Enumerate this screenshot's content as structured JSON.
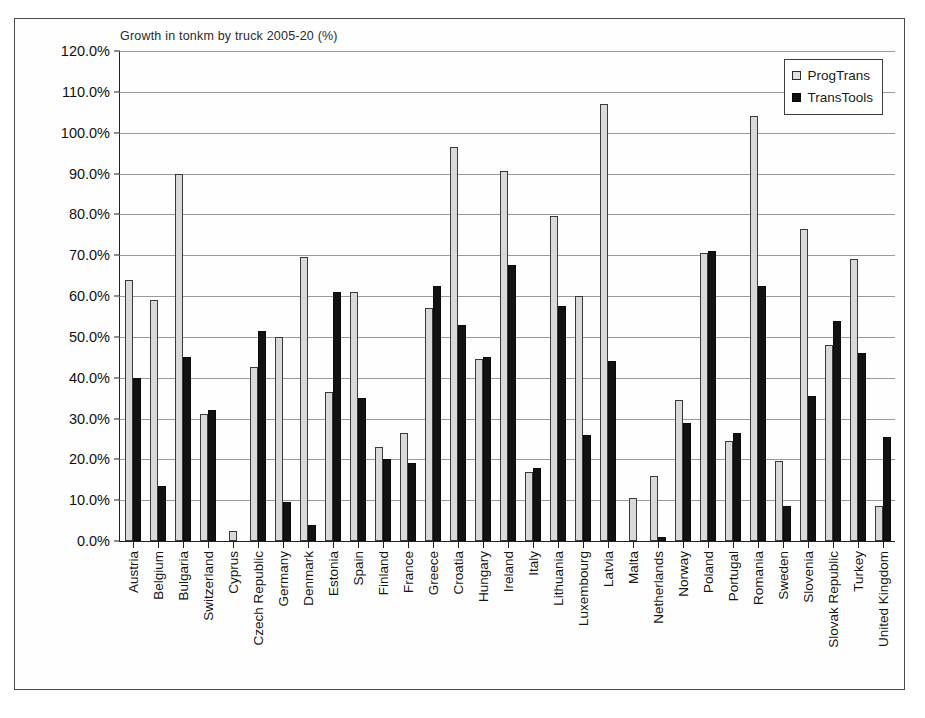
{
  "chart_data": {
    "type": "bar",
    "title": "Growth in tonkm by truck 2005-20 (%)",
    "xlabel": "",
    "ylabel": "",
    "ylim": [
      0,
      120
    ],
    "ytick_step": 10,
    "grid": true,
    "legend_position": "top-right",
    "ytick_labels": [
      "120.0%",
      "110.0%",
      "100.0%",
      "90.0%",
      "80.0%",
      "70.0%",
      "60.0%",
      "50.0%",
      "40.0%",
      "30.0%",
      "20.0%",
      "10.0%",
      "0.0%"
    ],
    "categories": [
      "Austria",
      "Belgium",
      "Bulgaria",
      "Switzerland",
      "Cyprus",
      "Czech Republic",
      "Germany",
      "Denmark",
      "Estonia",
      "Spain",
      "Finland",
      "France",
      "Greece",
      "Croatia",
      "Hungary",
      "Ireland",
      "Italy",
      "Lithuania",
      "Luxembourg",
      "Latvia",
      "Malta",
      "Netherlands",
      "Norway",
      "Poland",
      "Portugal",
      "Romania",
      "Sweden",
      "Slovenia",
      "Slovak Republic",
      "Turkey",
      "United Kingdom"
    ],
    "series": [
      {
        "name": "ProgTrans",
        "color": "#d9d9d9",
        "values": [
          64.0,
          59.0,
          90.0,
          31.0,
          2.5,
          42.5,
          50.0,
          69.5,
          36.5,
          61.0,
          23.0,
          26.5,
          57.0,
          96.5,
          44.5,
          90.5,
          17.0,
          79.5,
          60.0,
          107.0,
          10.5,
          16.0,
          34.5,
          70.5,
          24.5,
          104.0,
          19.5,
          76.5,
          48.0,
          69.0,
          8.5
        ]
      },
      {
        "name": "TransTools",
        "color": "#121212",
        "values": [
          40.0,
          13.5,
          45.0,
          32.0,
          0.0,
          51.5,
          9.5,
          4.0,
          61.0,
          35.0,
          20.0,
          19.0,
          62.5,
          53.0,
          45.0,
          67.5,
          18.0,
          57.5,
          26.0,
          44.0,
          0.0,
          1.0,
          29.0,
          71.0,
          26.5,
          62.5,
          8.5,
          35.5,
          54.0,
          46.0,
          25.5
        ]
      }
    ]
  },
  "legend": {
    "items": [
      {
        "label": "ProgTrans"
      },
      {
        "label": "TransTools"
      }
    ]
  }
}
